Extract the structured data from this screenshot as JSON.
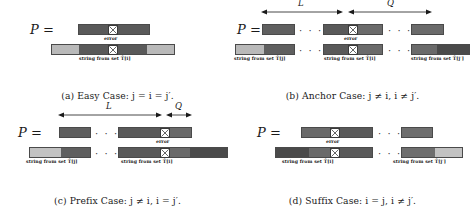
{
  "figure": {
    "colors": {
      "dark": "#595959",
      "mid": "#6e6e6e",
      "light": "#b9b9b9",
      "pale": "#cfcfcf",
      "darkest": "#4a4a4a",
      "outline": "#4a4a4a",
      "text": "#161616"
    },
    "labels": {
      "p_symbol": "P",
      "equals": "=",
      "error": "error",
      "dots": "· · ·",
      "arrow_L": "L",
      "arrow_Q": "Q"
    },
    "string_labels": {
      "set_i": "string from set T̂[i]",
      "set_j": "string from set T̂[j]",
      "set_jprime": "string from set T̂[j′]"
    },
    "panels": [
      {
        "id": "a",
        "caption_prefix": "(a) Easy Case: ",
        "caption_math": "j = i = j′.",
        "caption_full": "(a) Easy Case: j = i = j′.",
        "bottom_labels": [
          "string from set T̂[i]"
        ],
        "arrows": []
      },
      {
        "id": "b",
        "caption_prefix": "(b) Anchor Case: ",
        "caption_math": "j ≠ i, i ≠ j′.",
        "caption_full": "(b) Anchor Case: j ≠ i, i ≠ j′.",
        "bottom_labels": [
          "string from set T̂[j]",
          "string from set T̂[i]",
          "string from set T̂[j′]"
        ],
        "arrows": [
          "L",
          "Q"
        ]
      },
      {
        "id": "c",
        "caption_prefix": "(c) Prefix Case: ",
        "caption_math": "j ≠ i, i = j′.",
        "caption_full": "(c) Prefix Case: j ≠ i, i = j′.",
        "bottom_labels": [
          "string from set T̂[j]",
          "string from set T̂[i]"
        ],
        "arrows": [
          "L",
          "Q"
        ]
      },
      {
        "id": "d",
        "caption_prefix": "(d) Suffix Case: ",
        "caption_math": "i = j, i ≠ j′.",
        "caption_full": "(d) Suffix Case: i = j, i ≠ j′.",
        "bottom_labels": [
          "string from set T̂[i]",
          "string from set T̂[j′]"
        ],
        "arrows": []
      }
    ]
  }
}
